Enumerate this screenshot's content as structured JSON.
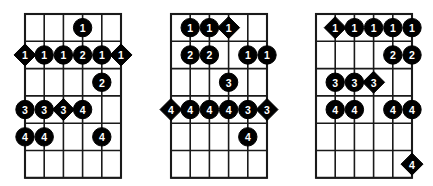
{
  "figure": {
    "diagram_count": 3,
    "strings": 6,
    "frets": 6,
    "marker_shapes": [
      "circle",
      "diamond"
    ],
    "marker_colors": {
      "fill": "#000000",
      "label": "#ffffff",
      "grid": "#1a1a1a",
      "background": "#ffffff"
    }
  },
  "diagrams": [
    {
      "name": "diagram-1",
      "index": 1,
      "markers": [
        {
          "string": 4,
          "fret": 1,
          "label": "1",
          "shape": "circle"
        },
        {
          "string": 1,
          "fret": 2,
          "label": "1",
          "shape": "diamond"
        },
        {
          "string": 2,
          "fret": 2,
          "label": "1",
          "shape": "circle"
        },
        {
          "string": 3,
          "fret": 2,
          "label": "1",
          "shape": "circle"
        },
        {
          "string": 4,
          "fret": 2,
          "label": "2",
          "shape": "circle"
        },
        {
          "string": 5,
          "fret": 2,
          "label": "1",
          "shape": "circle"
        },
        {
          "string": 6,
          "fret": 2,
          "label": "1",
          "shape": "diamond"
        },
        {
          "string": 5,
          "fret": 3,
          "label": "2",
          "shape": "circle"
        },
        {
          "string": 1,
          "fret": 4,
          "label": "3",
          "shape": "circle"
        },
        {
          "string": 2,
          "fret": 4,
          "label": "3",
          "shape": "circle"
        },
        {
          "string": 3,
          "fret": 4,
          "label": "3",
          "shape": "diamond"
        },
        {
          "string": 4,
          "fret": 4,
          "label": "4",
          "shape": "circle"
        },
        {
          "string": 1,
          "fret": 5,
          "label": "4",
          "shape": "circle"
        },
        {
          "string": 2,
          "fret": 5,
          "label": "4",
          "shape": "circle"
        },
        {
          "string": 5,
          "fret": 5,
          "label": "4",
          "shape": "circle"
        }
      ]
    },
    {
      "name": "diagram-2",
      "index": 2,
      "markers": [
        {
          "string": 2,
          "fret": 1,
          "label": "1",
          "shape": "circle"
        },
        {
          "string": 3,
          "fret": 1,
          "label": "1",
          "shape": "circle"
        },
        {
          "string": 4,
          "fret": 1,
          "label": "1",
          "shape": "diamond"
        },
        {
          "string": 2,
          "fret": 2,
          "label": "2",
          "shape": "circle"
        },
        {
          "string": 3,
          "fret": 2,
          "label": "2",
          "shape": "circle"
        },
        {
          "string": 5,
          "fret": 2,
          "label": "1",
          "shape": "circle"
        },
        {
          "string": 6,
          "fret": 2,
          "label": "1",
          "shape": "circle"
        },
        {
          "string": 4,
          "fret": 3,
          "label": "3",
          "shape": "circle"
        },
        {
          "string": 1,
          "fret": 4,
          "label": "4",
          "shape": "diamond"
        },
        {
          "string": 2,
          "fret": 4,
          "label": "4",
          "shape": "circle"
        },
        {
          "string": 3,
          "fret": 4,
          "label": "4",
          "shape": "circle"
        },
        {
          "string": 4,
          "fret": 4,
          "label": "4",
          "shape": "circle"
        },
        {
          "string": 5,
          "fret": 4,
          "label": "3",
          "shape": "circle"
        },
        {
          "string": 6,
          "fret": 4,
          "label": "3",
          "shape": "diamond"
        },
        {
          "string": 5,
          "fret": 5,
          "label": "4",
          "shape": "circle"
        }
      ]
    },
    {
      "name": "diagram-3",
      "index": 3,
      "markers": [
        {
          "string": 2,
          "fret": 1,
          "label": "1",
          "shape": "diamond"
        },
        {
          "string": 3,
          "fret": 1,
          "label": "1",
          "shape": "circle"
        },
        {
          "string": 4,
          "fret": 1,
          "label": "1",
          "shape": "circle"
        },
        {
          "string": 5,
          "fret": 1,
          "label": "1",
          "shape": "circle"
        },
        {
          "string": 6,
          "fret": 1,
          "label": "1",
          "shape": "circle"
        },
        {
          "string": 5,
          "fret": 2,
          "label": "2",
          "shape": "circle"
        },
        {
          "string": 6,
          "fret": 2,
          "label": "2",
          "shape": "circle"
        },
        {
          "string": 2,
          "fret": 3,
          "label": "3",
          "shape": "circle"
        },
        {
          "string": 3,
          "fret": 3,
          "label": "3",
          "shape": "circle"
        },
        {
          "string": 4,
          "fret": 3,
          "label": "3",
          "shape": "diamond"
        },
        {
          "string": 2,
          "fret": 4,
          "label": "4",
          "shape": "circle"
        },
        {
          "string": 3,
          "fret": 4,
          "label": "4",
          "shape": "circle"
        },
        {
          "string": 5,
          "fret": 4,
          "label": "4",
          "shape": "circle"
        },
        {
          "string": 6,
          "fret": 4,
          "label": "4",
          "shape": "circle"
        },
        {
          "string": 6,
          "fret": 6,
          "label": "4",
          "shape": "diamond"
        }
      ]
    }
  ],
  "geometry": {
    "diagram_offsets_x": [
      0,
      146,
      291
    ],
    "grid_left": 25,
    "grid_top": 14,
    "string_spacing": 19.2,
    "fret_spacing": 27.3,
    "marker_radius": 9.2,
    "diamond_radius": 11.0
  }
}
